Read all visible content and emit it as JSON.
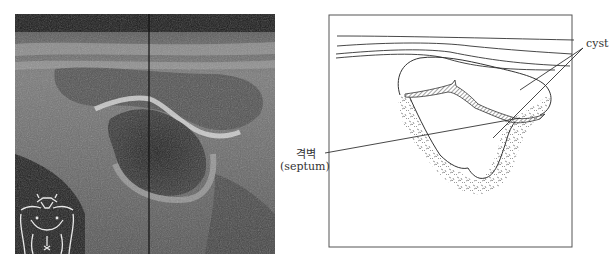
{
  "figure": {
    "left_panel": {
      "type": "ultrasound-image",
      "inset_icon": "body-outline-icon"
    },
    "right_panel": {
      "type": "schematic-diagram",
      "labels": {
        "cyst": "cyst",
        "septum_korean": "격벽",
        "septum_english": "(septum)"
      }
    }
  },
  "colors": {
    "ultrasound_bg": "#2a2a2a",
    "line": "#333333",
    "hatch": "#555555"
  }
}
